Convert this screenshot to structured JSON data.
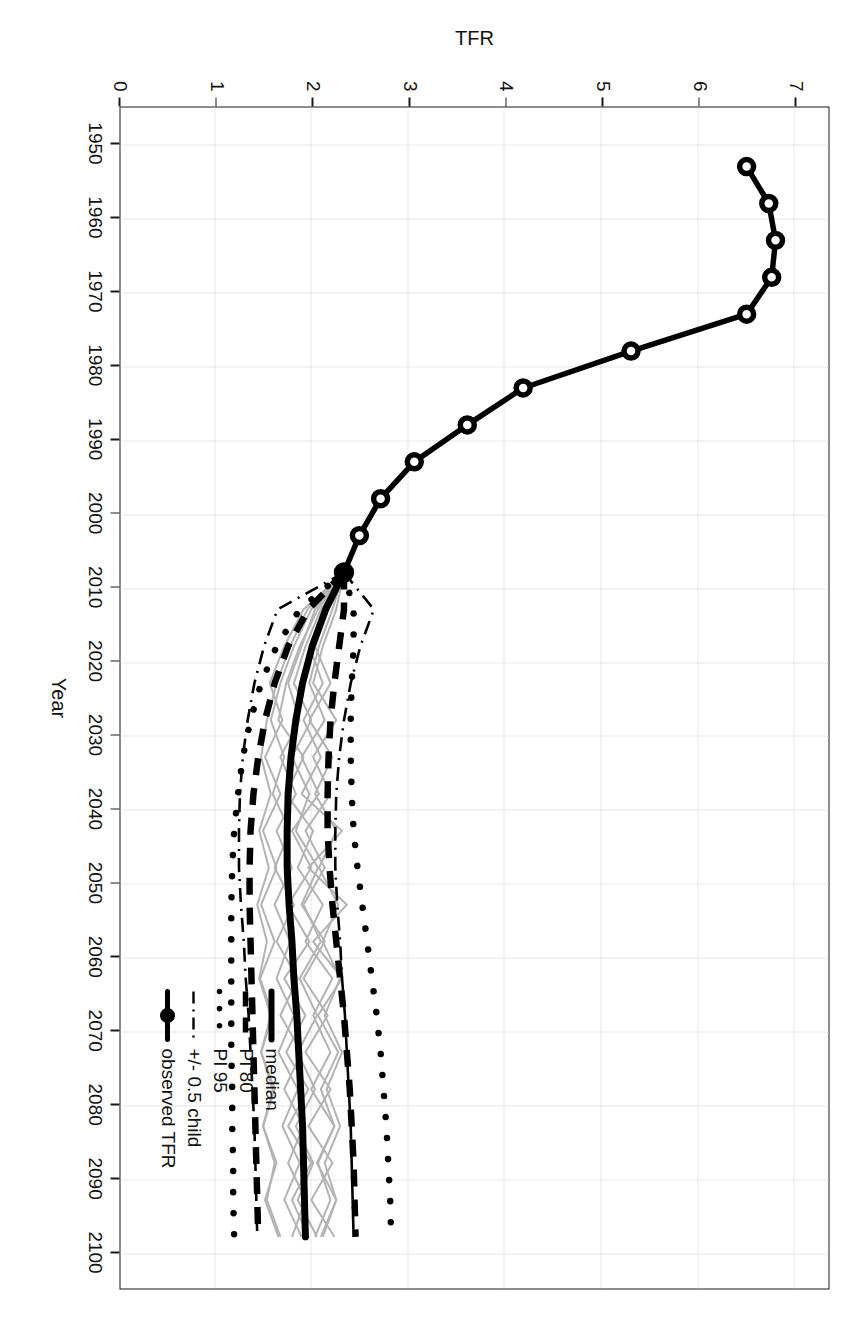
{
  "figure": {
    "orientation_deg": 90,
    "background": "#ffffff",
    "foreground": "#1a1a1a",
    "trajectory_color": "#b3b3b3",
    "grid_color": "#cfcfcf"
  },
  "chart_data": {
    "type": "line",
    "title": "",
    "xlabel": "Year",
    "ylabel": "TFR",
    "xlim": [
      1945,
      2105
    ],
    "ylim": [
      0,
      7.35
    ],
    "grid": true,
    "legend_position": "bottom-right",
    "xticks": [
      1950,
      1960,
      1970,
      1980,
      1990,
      2000,
      2010,
      2020,
      2030,
      2040,
      2050,
      2060,
      2070,
      2080,
      2090,
      2100
    ],
    "yticks": [
      0,
      1,
      2,
      3,
      4,
      5,
      6,
      7
    ],
    "xtick_labels": [
      "1950",
      "1960",
      "1970",
      "1980",
      "1990",
      "2000",
      "2010",
      "2020",
      "2030",
      "2040",
      "2050",
      "2060",
      "2070",
      "2080",
      "2090",
      "2100"
    ],
    "ytick_labels": [
      "0",
      "1",
      "2",
      "3",
      "4",
      "5",
      "6",
      "7"
    ],
    "legend": [
      {
        "label": "median",
        "style": "solid-thick",
        "color": "#000000"
      },
      {
        "label": "PI 80",
        "style": "dashed",
        "color": "#000000"
      },
      {
        "label": "PI 95",
        "style": "dotted",
        "color": "#000000"
      },
      {
        "label": "+/- 0.5 child",
        "style": "dashdot",
        "color": "#000000"
      },
      {
        "label": "observed TFR",
        "style": "solid-point",
        "color": "#000000"
      }
    ],
    "series": [
      {
        "name": "observed TFR",
        "style": "solid-point",
        "x": [
          1953,
          1958,
          1963,
          1968,
          1973,
          1978,
          1983,
          1988,
          1993,
          1998,
          2003,
          2008
        ],
        "values": [
          6.5,
          6.73,
          6.8,
          6.76,
          6.5,
          5.3,
          4.18,
          3.6,
          3.05,
          2.7,
          2.48,
          2.32
        ]
      },
      {
        "name": "median",
        "style": "solid-thick",
        "x": [
          2008,
          2013,
          2018,
          2023,
          2028,
          2033,
          2038,
          2043,
          2048,
          2053,
          2058,
          2063,
          2068,
          2073,
          2078,
          2083,
          2088,
          2093,
          2098
        ],
        "values": [
          2.32,
          2.13,
          1.99,
          1.89,
          1.82,
          1.77,
          1.74,
          1.73,
          1.73,
          1.75,
          1.78,
          1.8,
          1.83,
          1.85,
          1.87,
          1.89,
          1.9,
          1.91,
          1.92
        ]
      },
      {
        "name": "PI 80 lower",
        "style": "dashed",
        "x": [
          2008,
          2013,
          2018,
          2023,
          2028,
          2033,
          2038,
          2043,
          2048,
          2053,
          2058,
          2063,
          2068,
          2073,
          2078,
          2083,
          2088,
          2093,
          2098
        ],
        "values": [
          2.32,
          1.95,
          1.74,
          1.6,
          1.5,
          1.43,
          1.38,
          1.35,
          1.34,
          1.34,
          1.35,
          1.36,
          1.37,
          1.38,
          1.39,
          1.4,
          1.41,
          1.42,
          1.43
        ]
      },
      {
        "name": "PI 80 upper",
        "style": "dashed",
        "x": [
          2008,
          2013,
          2018,
          2023,
          2028,
          2033,
          2038,
          2043,
          2048,
          2053,
          2058,
          2063,
          2068,
          2073,
          2078,
          2083,
          2088,
          2093,
          2098
        ],
        "values": [
          2.32,
          2.32,
          2.27,
          2.22,
          2.18,
          2.16,
          2.15,
          2.15,
          2.17,
          2.2,
          2.24,
          2.28,
          2.32,
          2.35,
          2.38,
          2.4,
          2.42,
          2.43,
          2.44
        ]
      },
      {
        "name": "PI 95 lower",
        "style": "dotted",
        "x": [
          2008,
          2013,
          2018,
          2023,
          2028,
          2033,
          2038,
          2043,
          2048,
          2053,
          2058,
          2063,
          2068,
          2073,
          2078,
          2083,
          2088,
          2093,
          2098
        ],
        "values": [
          2.32,
          1.86,
          1.62,
          1.46,
          1.35,
          1.27,
          1.22,
          1.18,
          1.16,
          1.15,
          1.15,
          1.15,
          1.15,
          1.15,
          1.16,
          1.16,
          1.17,
          1.17,
          1.18
        ]
      },
      {
        "name": "PI 95 upper",
        "style": "dotted",
        "x": [
          2008,
          2013,
          2018,
          2023,
          2028,
          2033,
          2038,
          2043,
          2048,
          2053,
          2058,
          2063,
          2068,
          2073,
          2078,
          2083,
          2088,
          2093,
          2098
        ],
        "values": [
          2.32,
          2.42,
          2.42,
          2.4,
          2.39,
          2.39,
          2.4,
          2.42,
          2.46,
          2.51,
          2.56,
          2.61,
          2.66,
          2.7,
          2.73,
          2.76,
          2.78,
          2.8,
          2.81
        ]
      },
      {
        "name": "+/- 0.5 child lower",
        "style": "dashdot",
        "x": [
          2008,
          2013,
          2018,
          2023,
          2028,
          2033,
          2038,
          2043,
          2048,
          2053,
          2058,
          2063,
          2068,
          2073,
          2078,
          2083,
          2088,
          2093,
          2098
        ],
        "values": [
          2.32,
          1.63,
          1.49,
          1.39,
          1.32,
          1.27,
          1.24,
          1.23,
          1.23,
          1.25,
          1.28,
          1.3,
          1.33,
          1.35,
          1.37,
          1.39,
          1.4,
          1.41,
          1.42
        ]
      },
      {
        "name": "+/- 0.5 child upper",
        "style": "dashdot",
        "x": [
          2008,
          2013,
          2018,
          2023,
          2028,
          2033,
          2038,
          2043,
          2048,
          2053,
          2058,
          2063,
          2068,
          2073,
          2078,
          2083,
          2088,
          2093,
          2098
        ],
        "values": [
          2.32,
          2.63,
          2.49,
          2.39,
          2.32,
          2.27,
          2.24,
          2.23,
          2.23,
          2.25,
          2.28,
          2.3,
          2.33,
          2.35,
          2.37,
          2.39,
          2.4,
          2.41,
          2.42
        ]
      }
    ],
    "trajectories": [
      {
        "name": "traj-1",
        "x": [
          2008,
          2013,
          2018,
          2023,
          2028,
          2033,
          2038,
          2043,
          2048,
          2053,
          2058,
          2063,
          2068,
          2073,
          2078,
          2083,
          2088,
          2093,
          2098
        ],
        "values": [
          2.32,
          2.05,
          1.86,
          1.72,
          1.64,
          1.9,
          1.72,
          2.0,
          1.84,
          2.1,
          1.92,
          2.2,
          2.0,
          2.18,
          1.98,
          2.22,
          2.04,
          2.24,
          2.1
        ]
      },
      {
        "name": "traj-2",
        "x": [
          2008,
          2013,
          2018,
          2023,
          2028,
          2033,
          2038,
          2043,
          2048,
          2053,
          2058,
          2063,
          2068,
          2073,
          2078,
          2083,
          2088,
          2093,
          2098
        ],
        "values": [
          2.32,
          2.2,
          2.06,
          1.96,
          2.12,
          1.88,
          2.06,
          1.78,
          1.98,
          1.74,
          1.96,
          1.7,
          1.92,
          1.72,
          1.95,
          1.74,
          1.98,
          1.78,
          1.95
        ]
      },
      {
        "name": "traj-3",
        "x": [
          2008,
          2013,
          2018,
          2023,
          2028,
          2033,
          2038,
          2043,
          2048,
          2053,
          2058,
          2063,
          2068,
          2073,
          2078,
          2083,
          2088,
          2093,
          2098
        ],
        "values": [
          2.32,
          1.9,
          1.7,
          1.55,
          1.68,
          1.5,
          1.66,
          1.48,
          1.62,
          1.46,
          1.6,
          1.45,
          1.58,
          1.46,
          1.6,
          1.48,
          1.62,
          1.5,
          1.64
        ]
      },
      {
        "name": "traj-4",
        "x": [
          2008,
          2013,
          2018,
          2023,
          2028,
          2033,
          2038,
          2043,
          2048,
          2053,
          2058,
          2063,
          2068,
          2073,
          2078,
          2083,
          2088,
          2093,
          2098
        ],
        "values": [
          2.32,
          2.12,
          1.96,
          2.1,
          1.9,
          2.08,
          1.88,
          2.3,
          1.95,
          2.35,
          2.0,
          2.3,
          2.05,
          2.26,
          2.08,
          2.22,
          2.05,
          2.18,
          2.02
        ]
      },
      {
        "name": "traj-5",
        "x": [
          2008,
          2013,
          2018,
          2023,
          2028,
          2033,
          2038,
          2043,
          2048,
          2053,
          2058,
          2063,
          2068,
          2073,
          2078,
          2083,
          2088,
          2093,
          2098
        ],
        "values": [
          2.32,
          1.98,
          1.8,
          1.66,
          1.56,
          1.7,
          1.58,
          1.76,
          1.6,
          1.8,
          1.62,
          1.84,
          1.66,
          1.88,
          1.7,
          1.9,
          1.74,
          1.92,
          1.78
        ]
      },
      {
        "name": "traj-6",
        "x": [
          2008,
          2013,
          2018,
          2023,
          2028,
          2033,
          2038,
          2043,
          2048,
          2053,
          2058,
          2063,
          2068,
          2073,
          2078,
          2083,
          2088,
          2093,
          2098
        ],
        "values": [
          2.32,
          2.08,
          1.92,
          1.8,
          1.98,
          1.78,
          1.96,
          1.82,
          2.05,
          1.88,
          2.12,
          1.9,
          2.15,
          1.92,
          2.18,
          1.95,
          2.2,
          1.98,
          2.22
        ]
      },
      {
        "name": "traj-7",
        "x": [
          2008,
          2013,
          2018,
          2023,
          2028,
          2033,
          2038,
          2043,
          2048,
          2053,
          2058,
          2063,
          2068,
          2073,
          2078,
          2083,
          2088,
          2093,
          2098
        ],
        "values": [
          2.32,
          1.94,
          1.76,
          1.62,
          1.52,
          1.46,
          1.56,
          1.44,
          1.54,
          1.42,
          1.52,
          1.44,
          1.56,
          1.46,
          1.58,
          1.48,
          1.6,
          1.52,
          1.66
        ]
      },
      {
        "name": "traj-8",
        "x": [
          2008,
          2013,
          2018,
          2023,
          2028,
          2033,
          2038,
          2043,
          2048,
          2053,
          2058,
          2063,
          2068,
          2073,
          2078,
          2083,
          2088,
          2093,
          2098
        ],
        "values": [
          2.32,
          2.16,
          2.02,
          2.18,
          1.96,
          2.2,
          2.02,
          2.24,
          2.06,
          2.26,
          2.1,
          2.28,
          2.12,
          2.3,
          2.14,
          2.28,
          2.12,
          2.24,
          2.08
        ]
      },
      {
        "name": "traj-9",
        "x": [
          2008,
          2013,
          2018,
          2023,
          2028,
          2033,
          2038,
          2043,
          2048,
          2053,
          2058,
          2063,
          2068,
          2073,
          2078,
          2083,
          2088,
          2093,
          2098
        ],
        "values": [
          2.32,
          2.02,
          1.88,
          1.74,
          1.86,
          1.66,
          1.82,
          1.62,
          1.78,
          1.6,
          1.76,
          1.62,
          1.8,
          1.64,
          1.84,
          1.68,
          1.86,
          1.7,
          1.88
        ]
      },
      {
        "name": "traj-10",
        "x": [
          2008,
          2013,
          2018,
          2023,
          2028,
          2033,
          2038,
          2043,
          2048,
          2053,
          2058,
          2063,
          2068,
          2073,
          2078,
          2083,
          2088,
          2093,
          2098
        ],
        "values": [
          2.32,
          2.24,
          2.1,
          2.0,
          2.24,
          2.0,
          2.18,
          1.92,
          2.12,
          1.9,
          2.08,
          1.86,
          2.04,
          1.84,
          2.02,
          1.82,
          2.0,
          1.84,
          2.04
        ]
      }
    ]
  }
}
